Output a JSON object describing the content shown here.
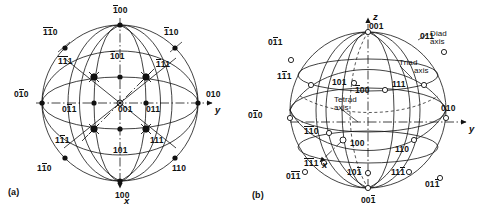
{
  "figure": {
    "panels": [
      {
        "tag": "(a)",
        "name": "stereographic-projection"
      },
      {
        "tag": "(b)",
        "name": "spherical-projection"
      }
    ]
  },
  "axes": {
    "x": "x",
    "y": "y",
    "z": "z"
  },
  "symmetry_labels": {
    "diad": "Diad\naxis",
    "diad_l1": "Diad",
    "diad_l2": "axis",
    "triad_l1": "Triad",
    "triad_l2": "axis",
    "tetrad_l1": "Tetrad",
    "tetrad_l2": "axis"
  },
  "panel_a": {
    "tag": "(a)",
    "poles": [
      {
        "id": "p-100bar",
        "text": "100",
        "bars": [
          0
        ],
        "x": 113,
        "y": 6
      },
      {
        "id": "p-110bb",
        "text": "110",
        "bars": [
          0,
          1
        ],
        "x": 43,
        "y": 28
      },
      {
        "id": "p-110bar",
        "text": "110",
        "bars": [
          0
        ],
        "x": 164,
        "y": 28
      },
      {
        "id": "p-111bb",
        "text": "111",
        "bars": [
          0,
          1
        ],
        "x": 58,
        "y": 57
      },
      {
        "id": "p-101bar",
        "text": "101",
        "bars": [
          0
        ],
        "x": 110,
        "y": 52
      },
      {
        "id": "p-111bar",
        "text": "111",
        "bars": [
          0
        ],
        "x": 156,
        "y": 60
      },
      {
        "id": "p-010bar",
        "text": "010",
        "bars": [
          1
        ],
        "x": 14,
        "y": 90
      },
      {
        "id": "p-011bar",
        "text": "011",
        "bars": [
          1
        ],
        "x": 62,
        "y": 105
      },
      {
        "id": "p-001",
        "text": "001",
        "bars": [],
        "x": 118,
        "y": 105
      },
      {
        "id": "p-011",
        "text": "011",
        "bars": [],
        "x": 146,
        "y": 105
      },
      {
        "id": "p-010",
        "text": "010",
        "bars": [],
        "x": 206,
        "y": 90
      },
      {
        "id": "p-111m",
        "text": "111",
        "bars": [
          1
        ],
        "x": 55,
        "y": 136
      },
      {
        "id": "p-101",
        "text": "101",
        "bars": [],
        "x": 113,
        "y": 146
      },
      {
        "id": "p-111",
        "text": "111",
        "bars": [],
        "x": 150,
        "y": 136
      },
      {
        "id": "p-110m",
        "text": "110",
        "bars": [
          1
        ],
        "x": 37,
        "y": 164
      },
      {
        "id": "p-110",
        "text": "110",
        "bars": [],
        "x": 172,
        "y": 164
      },
      {
        "id": "p-100",
        "text": "100",
        "bars": [],
        "x": 115,
        "y": 191
      }
    ]
  },
  "panel_b": {
    "tag": "(b)",
    "poles": [
      {
        "id": "q-001t",
        "text": "001",
        "bars": [],
        "x": 369,
        "y": 22
      },
      {
        "id": "q-011bar",
        "text": "011",
        "bars": [
          1
        ],
        "x": 268,
        "y": 38
      },
      {
        "id": "q-011",
        "text": "011",
        "bars": [],
        "x": 420,
        "y": 32
      },
      {
        "id": "q-111m",
        "text": "111",
        "bars": [
          1
        ],
        "x": 277,
        "y": 72
      },
      {
        "id": "q-101",
        "text": "101",
        "bars": [],
        "x": 332,
        "y": 78
      },
      {
        "id": "q-100bar",
        "text": "100",
        "bars": [
          0
        ],
        "x": 355,
        "y": 86
      },
      {
        "id": "q-111",
        "text": "111",
        "bars": [],
        "x": 392,
        "y": 80
      },
      {
        "id": "q-010bar",
        "text": "010",
        "bars": [
          1
        ],
        "x": 248,
        "y": 111
      },
      {
        "id": "q-010",
        "text": "010",
        "bars": [],
        "x": 441,
        "y": 104
      },
      {
        "id": "q-110bb",
        "text": "110",
        "bars": [
          0,
          1
        ],
        "x": 304,
        "y": 127
      },
      {
        "id": "q-100",
        "text": "100",
        "bars": [],
        "x": 350,
        "y": 139
      },
      {
        "id": "q-110",
        "text": "110",
        "bars": [],
        "x": 395,
        "y": 145
      },
      {
        "id": "q-111bb",
        "text": "111",
        "bars": [
          0,
          1
        ],
        "x": 304,
        "y": 159
      },
      {
        "id": "q-011bb",
        "text": "011",
        "bars": [
          1,
          2
        ],
        "x": 286,
        "y": 172
      },
      {
        "id": "q-101bar",
        "text": "101",
        "bars": [
          2
        ],
        "x": 347,
        "y": 168
      },
      {
        "id": "q-111bar",
        "text": "111",
        "bars": [
          2
        ],
        "x": 391,
        "y": 168
      },
      {
        "id": "q-011bar2",
        "text": "011",
        "bars": [
          2
        ],
        "x": 425,
        "y": 180
      },
      {
        "id": "q-001bar",
        "text": "001",
        "bars": [
          2
        ],
        "x": 361,
        "y": 196
      }
    ]
  }
}
